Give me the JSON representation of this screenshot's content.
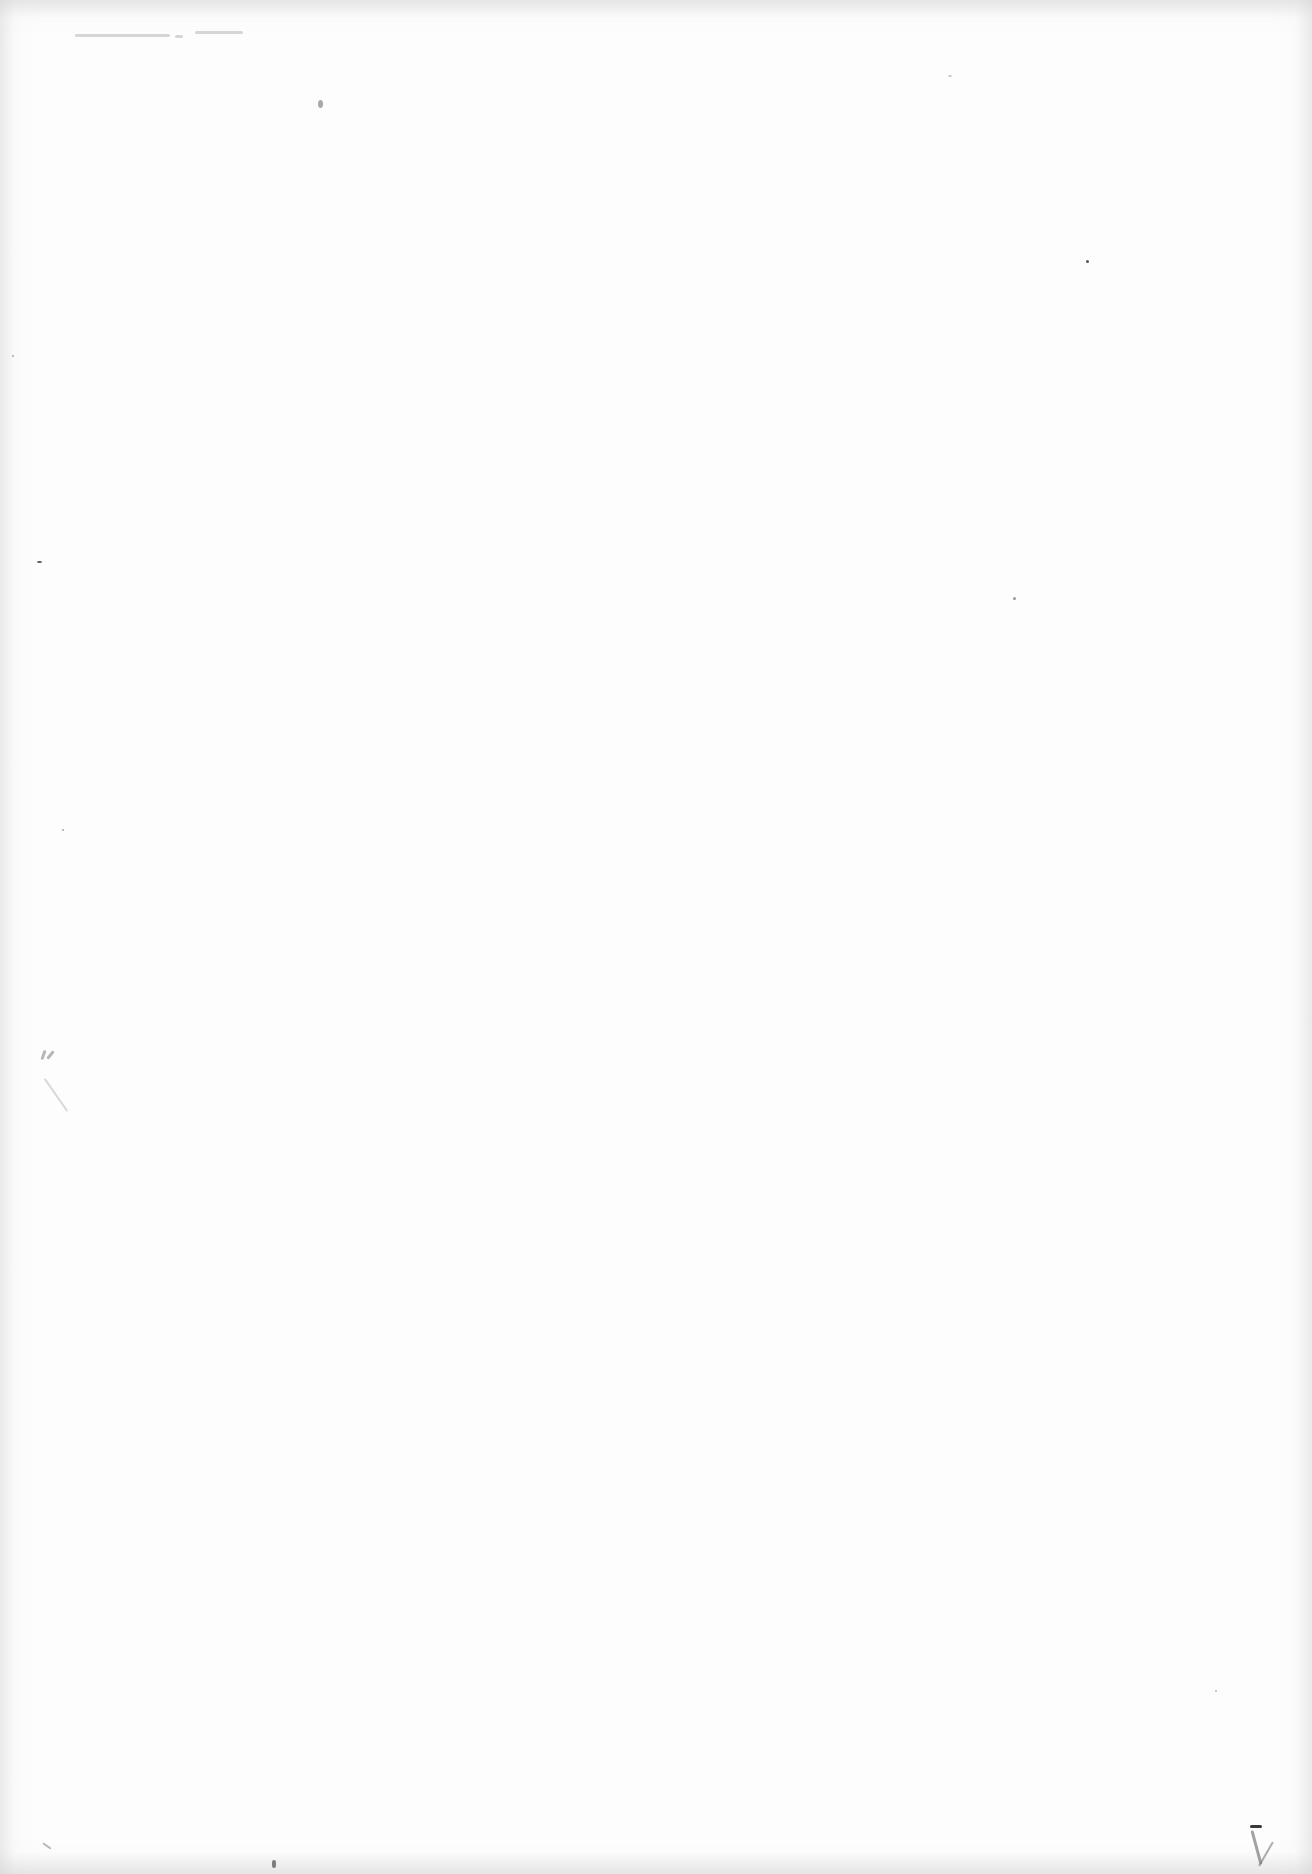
{
  "document": {
    "type": "scanned blank page",
    "header_note": {
      "text": null,
      "legible": false
    },
    "margin_mark": {
      "text": null,
      "legible": false
    }
  }
}
